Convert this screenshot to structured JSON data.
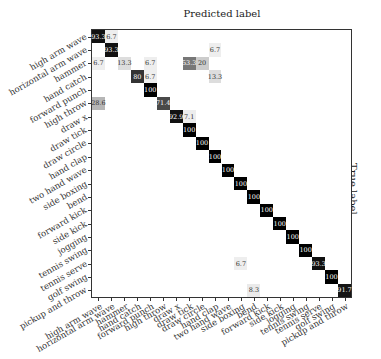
{
  "chart_data": {
    "type": "heatmap",
    "title": "Predicted label",
    "xlabel": "Predicted label",
    "ylabel": "True label",
    "labels": [
      "high arm wave",
      "horizontal arm wave",
      "hammer",
      "hand catch",
      "forward punch",
      "high throw",
      "draw x",
      "draw tick",
      "draw circle",
      "hand clap",
      "two hand wave",
      "side boxing",
      "bend",
      "forward kick",
      "side kick",
      "jogging",
      "tennis swing",
      "tennis serve",
      "golf swing",
      "pickup and throw"
    ],
    "cells": [
      {
        "row": 0,
        "col": 0,
        "value": "93.3"
      },
      {
        "row": 0,
        "col": 1,
        "value": "6.7"
      },
      {
        "row": 1,
        "col": 1,
        "value": "93.3"
      },
      {
        "row": 1,
        "col": 9,
        "value": "6.7"
      },
      {
        "row": 2,
        "col": 0,
        "value": "6.7"
      },
      {
        "row": 2,
        "col": 2,
        "value": "13.3"
      },
      {
        "row": 2,
        "col": 4,
        "value": "6.7"
      },
      {
        "row": 2,
        "col": 7,
        "value": "53.3"
      },
      {
        "row": 2,
        "col": 8,
        "value": "20"
      },
      {
        "row": 3,
        "col": 3,
        "value": "80"
      },
      {
        "row": 3,
        "col": 4,
        "value": "6.7"
      },
      {
        "row": 3,
        "col": 9,
        "value": "13.3"
      },
      {
        "row": 4,
        "col": 4,
        "value": "100"
      },
      {
        "row": 5,
        "col": 0,
        "value": "28.6"
      },
      {
        "row": 5,
        "col": 5,
        "value": "71.4"
      },
      {
        "row": 6,
        "col": 6,
        "value": "92.9"
      },
      {
        "row": 6,
        "col": 7,
        "value": "7.1"
      },
      {
        "row": 7,
        "col": 7,
        "value": "100"
      },
      {
        "row": 8,
        "col": 8,
        "value": "100"
      },
      {
        "row": 9,
        "col": 9,
        "value": "100"
      },
      {
        "row": 10,
        "col": 10,
        "value": "100"
      },
      {
        "row": 11,
        "col": 11,
        "value": "100"
      },
      {
        "row": 12,
        "col": 12,
        "value": "100"
      },
      {
        "row": 13,
        "col": 13,
        "value": "100"
      },
      {
        "row": 14,
        "col": 14,
        "value": "100"
      },
      {
        "row": 15,
        "col": 15,
        "value": "100"
      },
      {
        "row": 16,
        "col": 16,
        "value": "100"
      },
      {
        "row": 17,
        "col": 11,
        "value": "6.7"
      },
      {
        "row": 17,
        "col": 17,
        "value": "93.3"
      },
      {
        "row": 18,
        "col": 18,
        "value": "100"
      },
      {
        "row": 19,
        "col": 12,
        "value": "8.3"
      },
      {
        "row": 19,
        "col": 19,
        "value": "91.7"
      }
    ],
    "colormap": "greys",
    "value_range": [
      0,
      100
    ]
  }
}
